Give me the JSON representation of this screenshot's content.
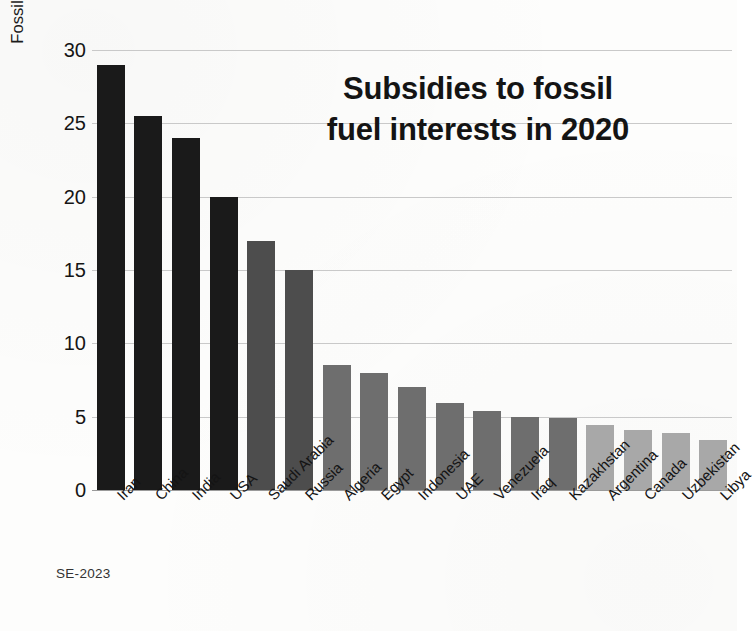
{
  "credit": "SE-2023",
  "chart_data": {
    "type": "bar",
    "title_lines": [
      "Subsidies to fossil",
      "fuel interests in 2020"
    ],
    "xlabel": "",
    "ylabel": "Fossil-fuel subsidies in billions of US$ in 2020",
    "ylim": [
      0,
      30
    ],
    "yticks": [
      0,
      5,
      10,
      15,
      20,
      25,
      30
    ],
    "ytick_labels": [
      "0",
      "5",
      "10",
      "15",
      "20",
      "25",
      "30"
    ],
    "grid": true,
    "legend": "none",
    "categories": [
      "Iran",
      "China",
      "India",
      "USA",
      "Saudi Arabia",
      "Russia",
      "Algeria",
      "Egypt",
      "Indonesia",
      "UAE",
      "Venezuela",
      "Iraq",
      "Kazakhstan",
      "Argentina",
      "Canada",
      "Uzbekistan",
      "Libya"
    ],
    "values": [
      29,
      25.5,
      24,
      20,
      17,
      15,
      8.5,
      8,
      7,
      5.9,
      5.4,
      5,
      4.9,
      4.4,
      4.1,
      3.9,
      3.4
    ],
    "bar_colors": [
      "#1a1a1a",
      "#1a1a1a",
      "#1a1a1a",
      "#1a1a1a",
      "#4d4d4d",
      "#4d4d4d",
      "#6e6e6e",
      "#6e6e6e",
      "#6e6e6e",
      "#6e6e6e",
      "#6e6e6e",
      "#6e6e6e",
      "#6e6e6e",
      "#a8a8a8",
      "#a8a8a8",
      "#a8a8a8",
      "#a8a8a8"
    ],
    "grid_color": "#c9c9c9",
    "axis_color": "#9a9a9a",
    "background_color": "#fdfdfc",
    "text_color": "#141414"
  }
}
